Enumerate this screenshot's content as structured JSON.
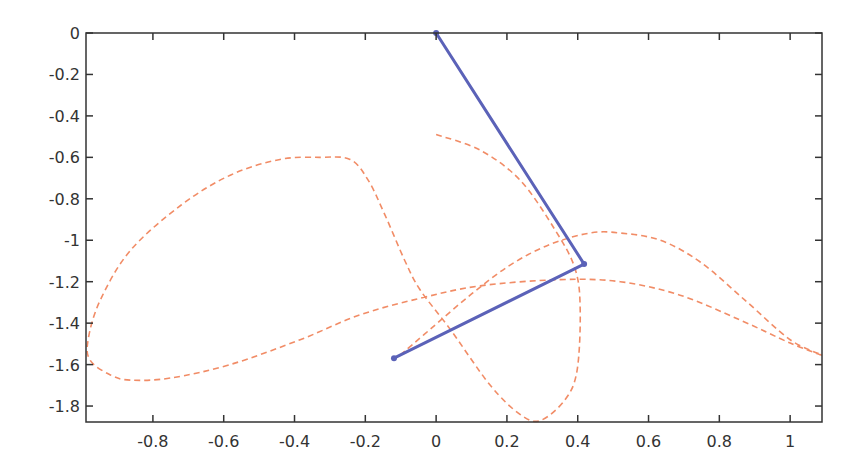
{
  "chart_data": {
    "type": "line",
    "title": "",
    "xlabel": "",
    "ylabel": "",
    "xlim": [
      -0.989,
      1.09
    ],
    "ylim": [
      -1.877,
      0
    ],
    "grid": false,
    "legend": null,
    "x_ticks": [
      -0.8,
      -0.6,
      -0.4,
      -0.2,
      0,
      0.2,
      0.4,
      0.6,
      0.8,
      1
    ],
    "x_tick_labels": [
      "-0.8",
      "-0.6",
      "-0.4",
      "-0.2",
      "0",
      "0.2",
      "0.4",
      "0.6",
      "0.8",
      "1"
    ],
    "y_ticks": [
      0,
      -0.2,
      -0.4,
      -0.6,
      -0.8,
      -1,
      -1.2,
      -1.4,
      -1.6,
      -1.8
    ],
    "y_tick_labels": [
      "0",
      "-0.2",
      "-0.4",
      "-0.6",
      "-0.8",
      "-1",
      "-1.2",
      "-1.4",
      "-1.6",
      "-1.8"
    ],
    "series": [
      {
        "name": "pendulum-arm",
        "style": "solid",
        "color": "#5b62b8",
        "x": [
          0,
          0.418,
          -0.119
        ],
        "y": [
          0,
          -1.115,
          -1.569
        ]
      },
      {
        "name": "end-effector-trace",
        "style": "dashed",
        "color": "#f07f55",
        "x": [
          0,
          0.124,
          0.237,
          0.336,
          0.393,
          0.407,
          0.398,
          0.364,
          0.294,
          0.237,
          0.153,
          0.04,
          -0.045,
          -0.088,
          -0.144,
          -0.192,
          -0.243,
          -0.328,
          -0.441,
          -0.58,
          -0.72,
          -0.864,
          -0.949,
          -0.983,
          -0.977,
          -0.92,
          -0.864,
          -0.751,
          -0.582,
          -0.384,
          -0.215,
          -0.045,
          0.124,
          0.35,
          0.52,
          0.689,
          0.859,
          1.0,
          1.09,
          1.0,
          0.873,
          0.746,
          0.633,
          0.52,
          0.435,
          0.322,
          0.209,
          0.096,
          -0.017,
          -0.102
        ],
        "y": [
          -0.49,
          -0.565,
          -0.71,
          -0.95,
          -1.14,
          -1.34,
          -1.63,
          -1.77,
          -1.87,
          -1.84,
          -1.7,
          -1.43,
          -1.24,
          -1.1,
          -0.88,
          -0.71,
          -0.61,
          -0.6,
          -0.61,
          -0.685,
          -0.83,
          -1.05,
          -1.29,
          -1.48,
          -1.58,
          -1.65,
          -1.675,
          -1.665,
          -1.6,
          -1.48,
          -1.36,
          -1.28,
          -1.22,
          -1.19,
          -1.2,
          -1.265,
          -1.385,
          -1.496,
          -1.554,
          -1.48,
          -1.29,
          -1.105,
          -1.0,
          -0.965,
          -0.965,
          -1.02,
          -1.12,
          -1.265,
          -1.43,
          -1.555
        ]
      }
    ],
    "markers": [
      {
        "name": "pivot",
        "x": 0,
        "y": 0
      },
      {
        "name": "elbow-joint",
        "x": 0.418,
        "y": -1.115
      },
      {
        "name": "end-effector",
        "x": -0.119,
        "y": -1.569
      }
    ]
  },
  "layout": {
    "plot_left_px": 86,
    "plot_top_px": 33,
    "plot_right_px": 822,
    "plot_bottom_px": 422,
    "axis_color": "#333333"
  }
}
